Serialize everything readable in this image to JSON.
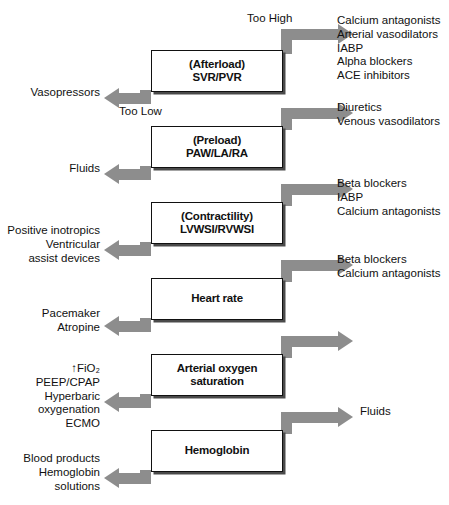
{
  "diagram": {
    "arrow_color": "#8d8d8d",
    "box_border_color": "#111111",
    "tags": {
      "too_high": "Too High",
      "too_low": "Too Low"
    },
    "nodes": [
      {
        "id": "afterload",
        "label": "(Afterload)\nSVR/PVR"
      },
      {
        "id": "preload",
        "label": "(Preload)\nPAW/LA/RA"
      },
      {
        "id": "contractility",
        "label": "(Contractility)\nLVWSI/RVWSI"
      },
      {
        "id": "heart-rate",
        "label": "Heart rate"
      },
      {
        "id": "arterial-o2",
        "label": "Arterial oxygen\nsaturation"
      },
      {
        "id": "hemoglobin",
        "label": "Hemoglobin"
      }
    ],
    "right_treatments": [
      "Calcium antagonists\nArterial vasodilators\nIABP\nAlpha blockers\nACE inhibitors",
      "Diuretics\nVenous vasodilators",
      "Beta blockers\nIABP\nCalcium antagonists",
      "Beta blockers\nCalcium antagonists",
      "",
      "Fluids"
    ],
    "left_treatments": [
      "Vasopressors",
      "Fluids",
      "Positive inotropics\nVentricular\n   assist devices",
      "Pacemaker\nAtropine",
      "↑FiO₂\n PEEP/CPAP\n Hyperbaric\n    oxygenation\n ECMO",
      "Blood products\nHemoglobin\n   solutions"
    ]
  }
}
